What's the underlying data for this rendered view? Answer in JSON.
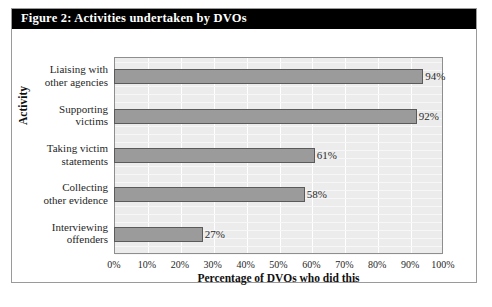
{
  "figure": {
    "title": "Figure 2: Activities undertaken by DVOs",
    "border_color": "#9a9a9a",
    "title_bar_color": "#000000",
    "title_text_color": "#ffffff"
  },
  "chart_data": {
    "type": "bar",
    "orientation": "horizontal",
    "title": "Figure 2: Activities undertaken by DVOs",
    "xlabel": "Percentage of DVOs who did this",
    "ylabel": "Activity",
    "categories": [
      "Liaising with other agencies",
      "Supporting victims",
      "Taking victim statements",
      "Collecting other evidence",
      "Interviewing offenders"
    ],
    "category_lines": [
      [
        "Liaising with",
        "other agencies"
      ],
      [
        "Supporting",
        "victims"
      ],
      [
        "Taking victim",
        "statements"
      ],
      [
        "Collecting",
        "other evidence"
      ],
      [
        "Interviewing",
        "offenders"
      ]
    ],
    "values": [
      94,
      92,
      61,
      58,
      27
    ],
    "data_labels": [
      "94%",
      "92%",
      "61%",
      "58%",
      "27%"
    ],
    "xlim": [
      0,
      100
    ],
    "xticks": [
      0,
      10,
      20,
      30,
      40,
      50,
      60,
      70,
      80,
      90,
      100
    ],
    "xtick_labels": [
      "0%",
      "10%",
      "20%",
      "30%",
      "40%",
      "50%",
      "60%",
      "70%",
      "80%",
      "90%",
      "100%"
    ],
    "grid": true,
    "grid_color": "#ffffff",
    "legend": false,
    "plot_background": "#ececec",
    "bar_fill": "#9b9b9b",
    "bar_border": "#5a5a5a"
  }
}
